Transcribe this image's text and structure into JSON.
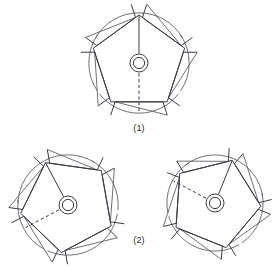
{
  "page": {
    "background_color": "#ffffff",
    "line_color": "#3a3a42"
  },
  "figures": [
    {
      "id": "figure-1",
      "caption": "(1)",
      "caption_x": 139,
      "caption_y": 131,
      "center": {
        "x": 139,
        "y": 63
      },
      "rotation_deg": 0,
      "radius": 48,
      "hub": {
        "outer_r": 9.0,
        "inner_r": 5.6
      },
      "crease_from_apex": true,
      "dashed_direction": "down",
      "arc_positions": [
        "top",
        "bottom"
      ]
    },
    {
      "id": "figure-2a",
      "caption": "",
      "center": {
        "x": 68,
        "y": 205
      },
      "rotation_deg": -28,
      "radius": 48,
      "hub": {
        "outer_r": 9.0,
        "inner_r": 5.6
      },
      "crease_from_apex": true,
      "dashed_direction": "down-left",
      "arc_positions": [
        "top",
        "bottom"
      ]
    },
    {
      "id": "figure-2b",
      "caption": "",
      "center": {
        "x": 215,
        "y": 203
      },
      "rotation_deg": 22,
      "radius": 46,
      "hub": {
        "outer_r": 9.0,
        "inner_r": 5.6
      },
      "crease_from_apex": true,
      "dashed_direction": "up-left",
      "arc_positions": [
        "top",
        "bottom"
      ]
    }
  ],
  "captions": [
    {
      "name": "caption-1",
      "text": "(1)",
      "x": 139,
      "y": 131
    },
    {
      "name": "caption-2",
      "text": "(2)",
      "x": 139,
      "y": 243
    }
  ],
  "chart_data": {
    "type": "diagram",
    "panels": [
      {
        "label": "(1)",
        "orientation_deg": 0,
        "dashed_crease": "downward to bottom edge with arrow flap"
      },
      {
        "label": "(2) left",
        "orientation_deg": -28,
        "dashed_crease": "toward lower-left vertex"
      },
      {
        "label": "(2) right",
        "orientation_deg": 22,
        "dashed_crease": "toward upper-left vertex"
      }
    ]
  }
}
